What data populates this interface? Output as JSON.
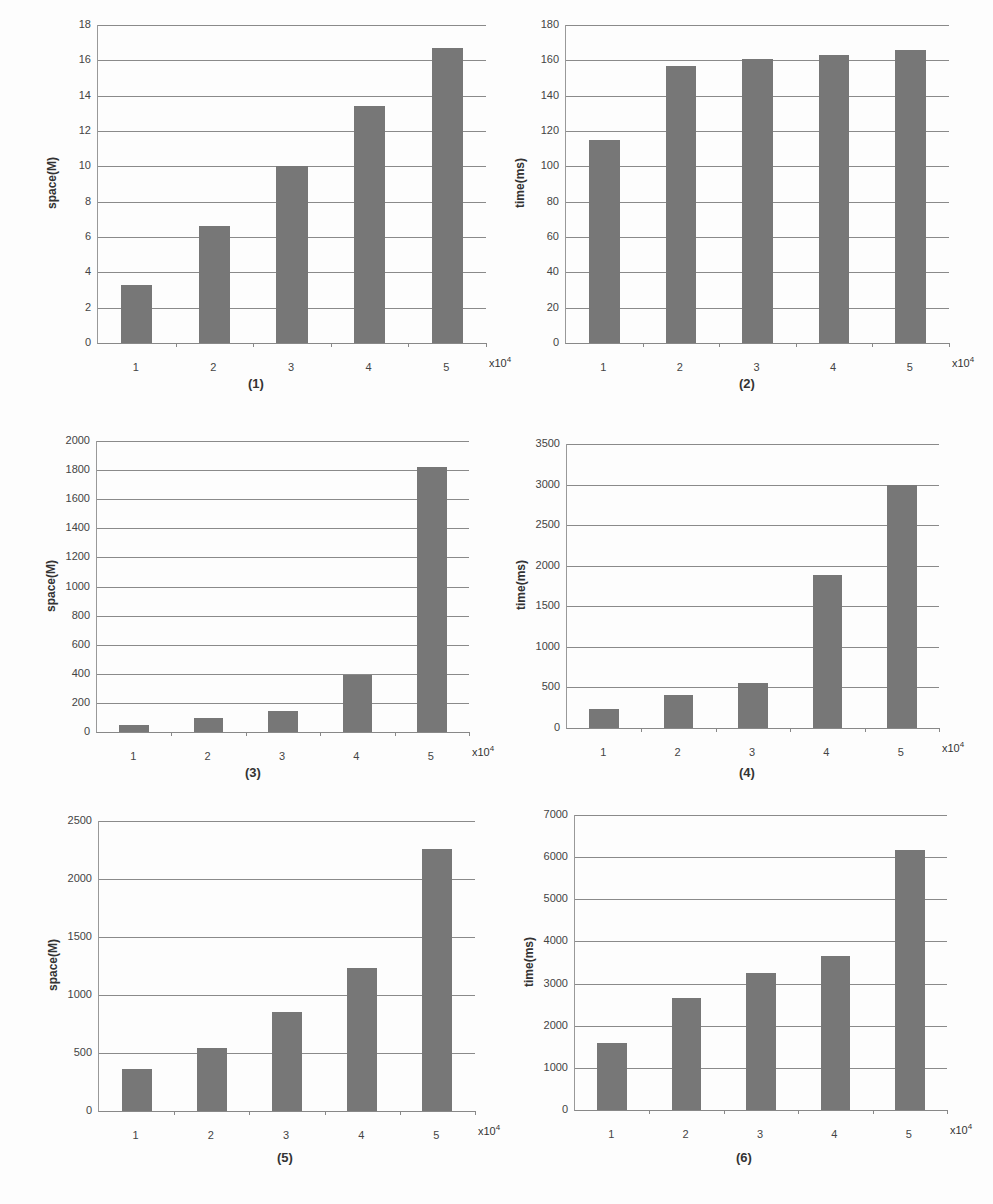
{
  "figure": {
    "x_unit_base": "x10",
    "x_unit_exp": "4"
  },
  "chart_data": [
    {
      "id": 1,
      "type": "bar",
      "caption": "(1)",
      "categories": [
        "1",
        "2",
        "3",
        "4",
        "5"
      ],
      "values": [
        3.3,
        6.6,
        10.0,
        13.4,
        16.7
      ],
      "xlabel": "x10^4",
      "ylabel": "space(M)",
      "ylim": [
        0,
        18
      ],
      "yticks": [
        0,
        2,
        4,
        6,
        8,
        10,
        12,
        14,
        16,
        18
      ],
      "grid": true
    },
    {
      "id": 2,
      "type": "bar",
      "caption": "(2)",
      "categories": [
        "1",
        "2",
        "3",
        "4",
        "5"
      ],
      "values": [
        115,
        157,
        161,
        163,
        166
      ],
      "xlabel": "x10^4",
      "ylabel": "time(ms)",
      "ylim": [
        0,
        180
      ],
      "yticks": [
        0,
        20,
        40,
        60,
        80,
        100,
        120,
        140,
        160,
        180
      ],
      "grid": true
    },
    {
      "id": 3,
      "type": "bar",
      "caption": "(3)",
      "categories": [
        "1",
        "2",
        "3",
        "4",
        "5"
      ],
      "values": [
        50,
        95,
        145,
        390,
        1820
      ],
      "xlabel": "x10^4",
      "ylabel": "space(M)",
      "ylim": [
        0,
        2000
      ],
      "yticks": [
        0,
        200,
        400,
        600,
        800,
        1000,
        1200,
        1400,
        1600,
        1800,
        2000
      ],
      "grid": true
    },
    {
      "id": 4,
      "type": "bar",
      "caption": "(4)",
      "categories": [
        "1",
        "2",
        "3",
        "4",
        "5"
      ],
      "values": [
        240,
        410,
        560,
        1880,
        3000
      ],
      "xlabel": "x10^4",
      "ylabel": "time(ms)",
      "ylim": [
        0,
        3500
      ],
      "yticks": [
        0,
        500,
        1000,
        1500,
        2000,
        2500,
        3000,
        3500
      ],
      "grid": true
    },
    {
      "id": 5,
      "type": "bar",
      "caption": "(5)",
      "categories": [
        "1",
        "2",
        "3",
        "4",
        "5"
      ],
      "values": [
        360,
        540,
        850,
        1230,
        2260
      ],
      "xlabel": "x10^4",
      "ylabel": "space(M)",
      "ylim": [
        0,
        2500
      ],
      "yticks": [
        0,
        500,
        1000,
        1500,
        2000,
        2500
      ],
      "grid": true
    },
    {
      "id": 6,
      "type": "bar",
      "caption": "(6)",
      "categories": [
        "1",
        "2",
        "3",
        "4",
        "5"
      ],
      "values": [
        1580,
        2650,
        3260,
        3650,
        6180
      ],
      "xlabel": "x10^4",
      "ylabel": "time(ms)",
      "ylim": [
        0,
        7000
      ],
      "yticks": [
        0,
        1000,
        2000,
        3000,
        4000,
        5000,
        6000,
        7000
      ],
      "grid": true
    }
  ],
  "colors": {
    "bar": "#777777",
    "grid": "#8a8a8a",
    "background": "#fdfdfd"
  }
}
